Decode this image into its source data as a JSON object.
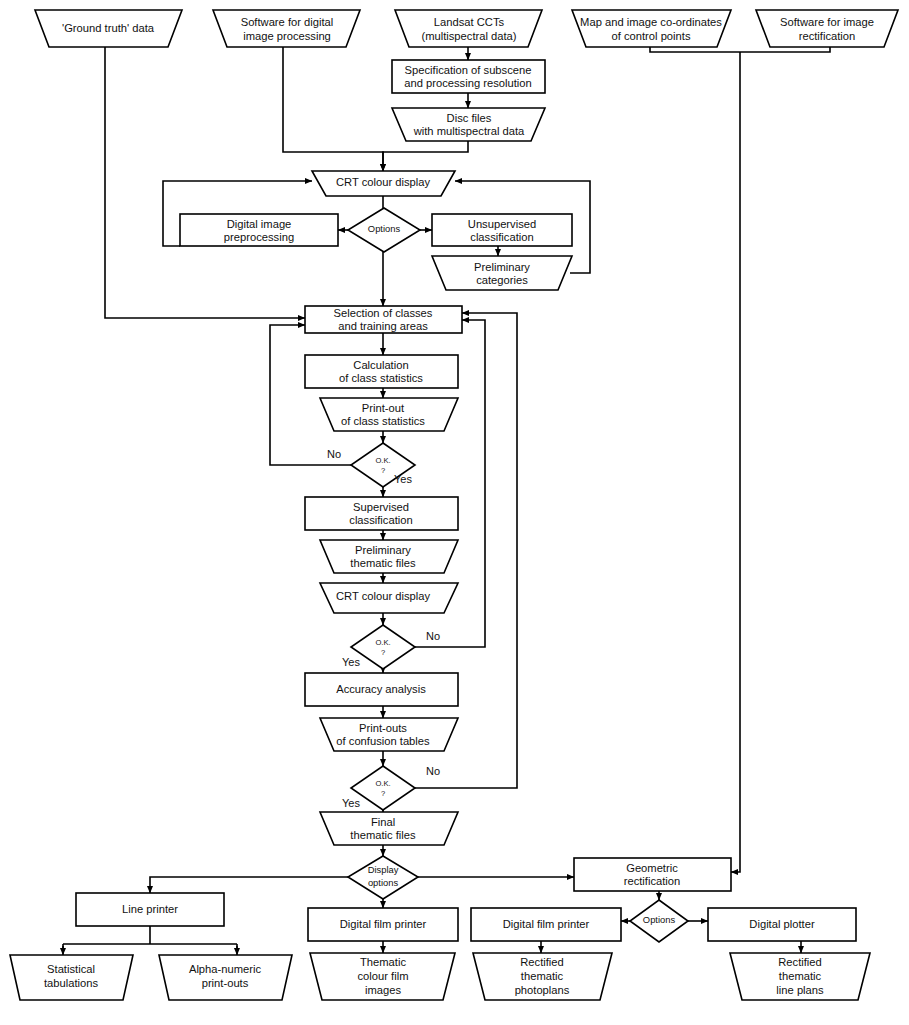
{
  "diagram": {
    "type": "flowchart",
    "stroke_color": "#000000",
    "fill_color": "#ffffff"
  },
  "nodes": {
    "ground_truth": {
      "label": "'Ground truth' data",
      "shape": "trapezoid"
    },
    "software_dip": {
      "label_1": "Software for digital",
      "label_2": "image processing",
      "shape": "trapezoid"
    },
    "landsat": {
      "label_1": "Landsat CCTs",
      "label_2": "(multispectral data)",
      "shape": "trapezoid"
    },
    "map_coords": {
      "label_1": "Map and image co-ordinates",
      "label_2": "of control points",
      "shape": "trapezoid"
    },
    "software_rect": {
      "label_1": "Software for image",
      "label_2": "rectification",
      "shape": "trapezoid"
    },
    "spec_subscene": {
      "label_1": "Specification of subscene",
      "label_2": "and processing resolution",
      "shape": "rect"
    },
    "disc_files": {
      "label_1": "Disc files",
      "label_2": "with multispectral data",
      "shape": "trapezoid"
    },
    "crt_top": {
      "label": "CRT colour display",
      "shape": "trapezoid"
    },
    "options_top": {
      "label": "Options",
      "shape": "diamond"
    },
    "preprocessing": {
      "label_1": "Digital image",
      "label_2": "preprocessing",
      "shape": "rect"
    },
    "unsupervised": {
      "label_1": "Unsupervised",
      "label_2": "classification",
      "shape": "rect"
    },
    "prelim_categories": {
      "label_1": "Preliminary",
      "label_2": "categories",
      "shape": "trapezoid"
    },
    "selection": {
      "label_1": "Selection of classes",
      "label_2": "and training areas",
      "shape": "rect"
    },
    "calculation": {
      "label_1": "Calculation",
      "label_2": "of class statistics",
      "shape": "rect"
    },
    "printout_stats": {
      "label_1": "Print-out",
      "label_2": "of class statistics",
      "shape": "trapezoid"
    },
    "ok1": {
      "label_1": "O.K.",
      "label_2": "?",
      "shape": "diamond",
      "no": "No",
      "yes": "Yes"
    },
    "supervised": {
      "label_1": "Supervised",
      "label_2": "classification",
      "shape": "rect"
    },
    "prelim_thematic": {
      "label_1": "Preliminary",
      "label_2": "thematic files",
      "shape": "trapezoid"
    },
    "crt_mid": {
      "label": "CRT colour display",
      "shape": "trapezoid"
    },
    "ok2": {
      "label_1": "O.K.",
      "label_2": "?",
      "shape": "diamond",
      "no": "No",
      "yes": "Yes"
    },
    "accuracy": {
      "label": "Accuracy analysis",
      "shape": "rect"
    },
    "printouts_confusion": {
      "label_1": "Print-outs",
      "label_2": "of confusion tables",
      "shape": "trapezoid"
    },
    "ok3": {
      "label_1": "O.K.",
      "label_2": "?",
      "shape": "diamond",
      "no": "No",
      "yes": "Yes"
    },
    "final_thematic": {
      "label_1": "Final",
      "label_2": "thematic files",
      "shape": "trapezoid"
    },
    "display_options": {
      "label_1": "Display",
      "label_2": "options",
      "shape": "diamond"
    },
    "geometric_rect": {
      "label_1": "Geometric",
      "label_2": "rectification",
      "shape": "rect"
    },
    "options_bottom": {
      "label": "Options",
      "shape": "diamond"
    },
    "line_printer": {
      "label": "Line printer",
      "shape": "rect"
    },
    "statistical_tab": {
      "label_1": "Statistical",
      "label_2": "tabulations",
      "shape": "trapezoid"
    },
    "alpha_numeric": {
      "label_1": "Alpha-numeric",
      "label_2": "print-outs",
      "shape": "trapezoid"
    },
    "film_printer_1": {
      "label": "Digital film printer",
      "shape": "rect"
    },
    "thematic_film": {
      "label_1": "Thematic",
      "label_2": "colour film",
      "label_3": "images",
      "shape": "trapezoid"
    },
    "film_printer_2": {
      "label": "Digital film printer",
      "shape": "rect"
    },
    "rect_photoplans": {
      "label_1": "Rectified",
      "label_2": "thematic",
      "label_3": "photoplans",
      "shape": "trapezoid"
    },
    "digital_plotter": {
      "label": "Digital plotter",
      "shape": "rect"
    },
    "rect_lineplans": {
      "label_1": "Rectified",
      "label_2": "thematic",
      "label_3": "line plans",
      "shape": "trapezoid"
    }
  }
}
